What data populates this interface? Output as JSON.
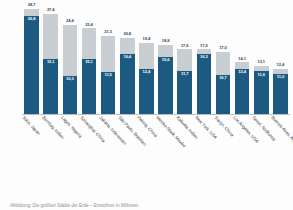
{
  "chart_data": {
    "type": "bar",
    "title": "",
    "subtitle": "",
    "xlabel": "",
    "ylabel": "",
    "ylim": [
      0,
      30
    ],
    "grid": false,
    "legend_position": "none",
    "categories": [
      "Tokio, Japan",
      "Bombay, Indien",
      "Lagos, Nigeria",
      "Schanghai, China",
      "Jakarta, Indonesien",
      "São Paulo, Brasilien",
      "Peking, China",
      "Mexiko-Stadt, Mexiko",
      "Kalkutta, Indien",
      "New York, USA",
      "Tianjin, China",
      "Los Angeles, USA",
      "Seoul, Südkorea",
      "Buenos Aires, Argentinien"
    ],
    "series": [
      {
        "name": "future",
        "color": "#c9ced3",
        "values": [
          28.7,
          27.4,
          24.4,
          23.4,
          21.3,
          20.8,
          19.4,
          18.8,
          17.6,
          17.6,
          17.0,
          14.1,
          13.1,
          12.4
        ]
      },
      {
        "name": "current",
        "color": "#1c5a82",
        "values": [
          26.8,
          15.1,
          10.3,
          15.1,
          11.5,
          16.4,
          12.4,
          15.6,
          11.7,
          16.3,
          10.7,
          12.4,
          11.6,
          11.0
        ]
      }
    ]
  },
  "footnote": "Abbildung: Die größten Städte der Erde – Einwohner in Millionen"
}
